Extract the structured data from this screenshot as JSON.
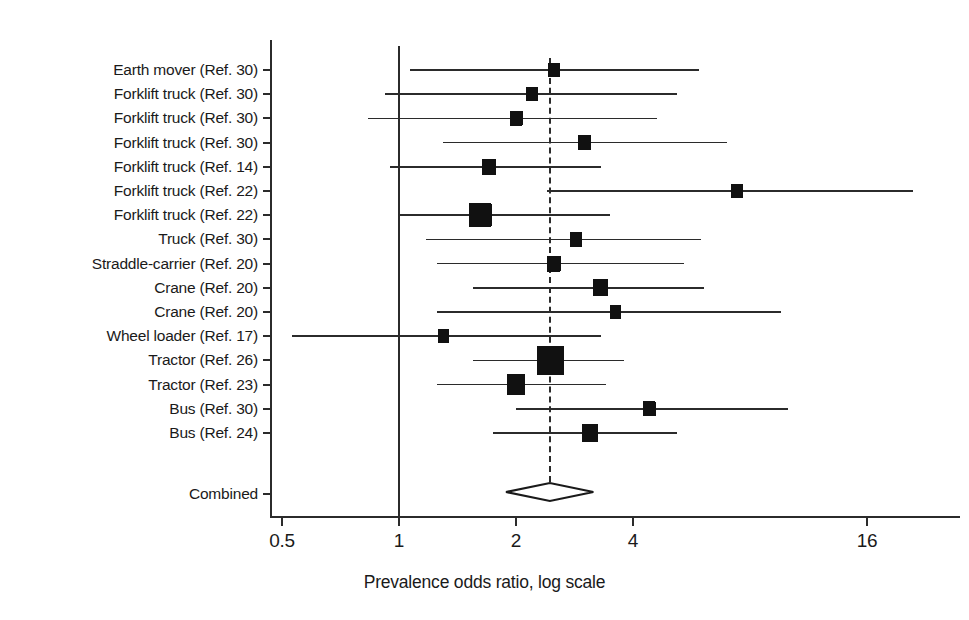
{
  "chart_data": {
    "type": "forest",
    "title": "",
    "xlabel": "Prevalence odds ratio, log scale",
    "ylabel": "",
    "xscale": "log",
    "xticks": [
      0.5,
      1,
      2,
      4,
      16
    ],
    "xticklabels": [
      "0.5",
      "1",
      "2",
      "4",
      "16"
    ],
    "xlim": [
      0.45,
      22
    ],
    "grid": false,
    "legend": null,
    "null_line": 1,
    "pooled_line": 2.44,
    "categories": [
      "Earth mover (Ref. 30)",
      "Forklift truck (Ref. 30)",
      "Forklift truck (Ref. 30)",
      "Forklift truck (Ref. 30)",
      "Forklift truck (Ref. 14)",
      "Forklift truck (Ref. 22)",
      "Forklift truck (Ref. 22)",
      "Truck (Ref. 30)",
      "Straddle-carrier (Ref. 20)",
      "Crane (Ref. 20)",
      "Crane (Ref. 20)",
      "Wheel loader (Ref. 17)",
      "Tractor (Ref. 26)",
      "Tractor (Ref. 23)",
      "Bus (Ref. 30)",
      "Bus (Ref. 24)"
    ],
    "studies": [
      {
        "label": "Earth mover (Ref. 30)",
        "or": 2.5,
        "ci_low": 1.07,
        "ci_high": 5.9,
        "weight": 0.3
      },
      {
        "label": "Forklift truck (Ref. 30)",
        "or": 2.2,
        "ci_low": 0.92,
        "ci_high": 5.2,
        "weight": 0.26
      },
      {
        "label": "Forklift truck (Ref. 30)",
        "or": 2.0,
        "ci_low": 0.83,
        "ci_high": 4.6,
        "weight": 0.34
      },
      {
        "label": "Forklift truck (Ref. 30)",
        "or": 3.0,
        "ci_low": 1.3,
        "ci_high": 7.0,
        "weight": 0.3
      },
      {
        "label": "Forklift truck (Ref. 14)",
        "or": 1.7,
        "ci_low": 0.95,
        "ci_high": 3.3,
        "weight": 0.42
      },
      {
        "label": "Forklift truck (Ref. 22)",
        "or": 7.4,
        "ci_low": 2.4,
        "ci_high": 21.0,
        "weight": 0.28
      },
      {
        "label": "Forklift truck (Ref. 22)",
        "or": 1.62,
        "ci_low": 1.0,
        "ci_high": 3.5,
        "weight": 1.0
      },
      {
        "label": "Truck (Ref. 30)",
        "or": 2.85,
        "ci_low": 1.17,
        "ci_high": 6.0,
        "weight": 0.32
      },
      {
        "label": "Straddle-carrier (Ref. 20)",
        "or": 2.5,
        "ci_low": 1.25,
        "ci_high": 5.4,
        "weight": 0.4
      },
      {
        "label": "Crane (Ref. 20)",
        "or": 3.3,
        "ci_low": 1.55,
        "ci_high": 6.1,
        "weight": 0.48
      },
      {
        "label": "Crane (Ref. 20)",
        "or": 3.6,
        "ci_low": 1.25,
        "ci_high": 9.6,
        "weight": 0.24
      },
      {
        "label": "Wheel loader (Ref. 17)",
        "or": 1.3,
        "ci_low": 0.53,
        "ci_high": 3.3,
        "weight": 0.22
      },
      {
        "label": "Tractor (Ref. 26)",
        "or": 2.45,
        "ci_low": 1.55,
        "ci_high": 3.8,
        "weight": 1.35
      },
      {
        "label": "Tractor (Ref. 23)",
        "or": 2.0,
        "ci_low": 1.25,
        "ci_high": 3.4,
        "weight": 0.72
      },
      {
        "label": "Bus (Ref. 30)",
        "or": 4.4,
        "ci_low": 2.0,
        "ci_high": 10.0,
        "weight": 0.32
      },
      {
        "label": "Bus (Ref. 24)",
        "or": 3.1,
        "ci_low": 1.75,
        "ci_high": 5.2,
        "weight": 0.55
      }
    ],
    "summary": {
      "label": "Combined",
      "or": 2.44,
      "ci_low": 2.02,
      "ci_high": 2.94
    }
  }
}
